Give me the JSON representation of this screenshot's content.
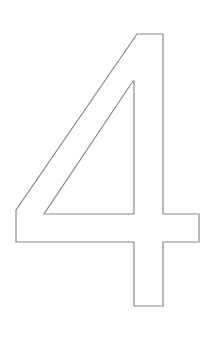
{
  "image": {
    "description": "Outlined numeral glyph",
    "glyph": "4",
    "background_color": "#ffffff",
    "stroke_color": "#8a8a8a",
    "stroke_width": 1.2
  },
  "shape": {
    "outer_path": "M137,34 L163,34 L163,214 L199,214 L199,242 L163,242 L163,306 L134,306 L134,242 L16,242 L16,210 Z",
    "inner_path": "M133,81 L134,81 L134,214 L44,214 Z"
  }
}
